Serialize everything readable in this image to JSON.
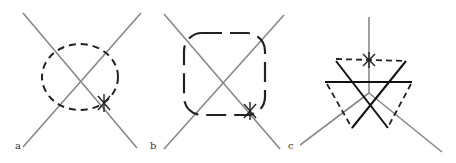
{
  "figure": {
    "panels": [
      {
        "id": "a",
        "label": "a",
        "description": "Two crossing grey lines with a dashed circle loop and a star marker"
      },
      {
        "id": "b",
        "label": "b",
        "description": "Two crossing grey lines with a long-dash rounded square loop and a star marker"
      },
      {
        "id": "c",
        "label": "c",
        "description": "Vertical grey line with two diagonal grey lines, dashed triangles and solid black triangle edges, star marker"
      }
    ],
    "colors": {
      "line": "#888888",
      "loop": "#222222",
      "background": "#ffffff"
    }
  }
}
